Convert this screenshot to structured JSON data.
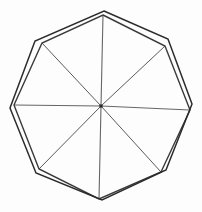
{
  "figure": {
    "background_color": "#fdfdfd",
    "center": {
      "x": 101,
      "y": 106
    },
    "stroke_colors": {
      "outer_polygon": "#2b2b2b",
      "inner_polygon": "#3a3a3a",
      "diagonal": "#5a5a5a",
      "axis": "#666666"
    }
  },
  "chart_data": {
    "type": "line",
    "subtitle": "",
    "xlabel": "",
    "ylabel": "",
    "grid": false,
    "legend": "none",
    "xlim": [
      0,
      202
    ],
    "ylim": [
      0,
      212
    ],
    "center": [
      101,
      106
    ],
    "series": [
      {
        "name": "outer-octagon",
        "closed": true,
        "n_sides": 8,
        "radius": 95,
        "rotation_deg": -88,
        "points": [
          [
            104,
            11
          ],
          [
            168,
            39
          ],
          [
            192,
            104
          ],
          [
            166,
            170
          ],
          [
            102,
            200
          ],
          [
            36,
            173
          ],
          [
            10,
            108
          ],
          [
            35,
            41
          ]
        ]
      },
      {
        "name": "inner-octagon",
        "closed": true,
        "n_sides": 8,
        "radius": 91,
        "rotation_deg": -94,
        "points": [
          [
            103,
            15
          ],
          [
            165,
            46
          ],
          [
            190,
            110
          ],
          [
            161,
            172
          ],
          [
            99,
            199
          ],
          [
            39,
            169
          ],
          [
            14,
            105
          ],
          [
            42,
            43
          ]
        ]
      },
      {
        "name": "radii",
        "closed": false,
        "n_spokes": 8,
        "endpoints": [
          [
            103,
            15
          ],
          [
            165,
            46
          ],
          [
            190,
            110
          ],
          [
            161,
            172
          ],
          [
            99,
            199
          ],
          [
            39,
            169
          ],
          [
            14,
            105
          ],
          [
            42,
            43
          ]
        ]
      }
    ]
  }
}
